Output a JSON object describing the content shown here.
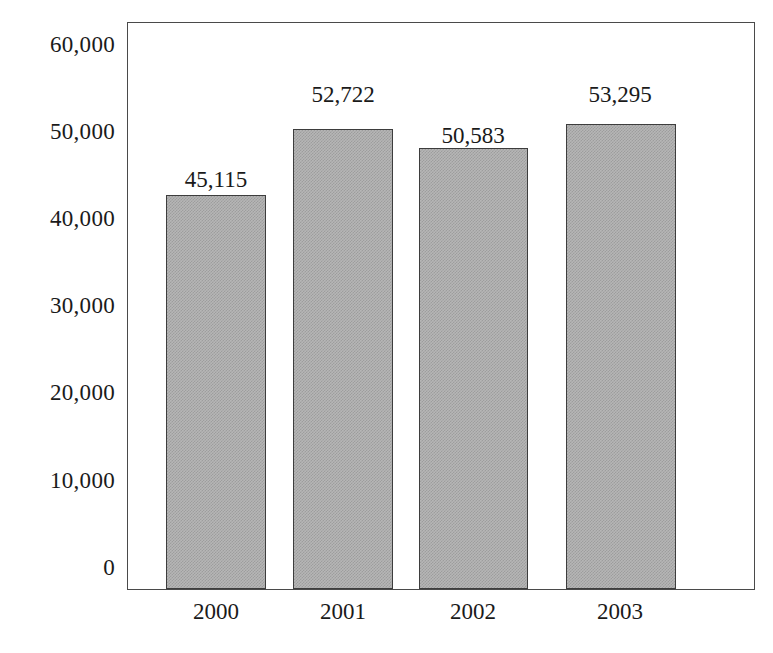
{
  "chart_data": {
    "type": "bar",
    "title": "",
    "subtitle": "",
    "xlabel": "",
    "ylabel": "",
    "categories": [
      "2000",
      "2001",
      "2002",
      "2003"
    ],
    "values": [
      45115,
      52722,
      50583,
      53295
    ],
    "value_labels": [
      "45,115",
      "52,722",
      "50,583",
      "53,295"
    ],
    "ylim": [
      0,
      60000
    ],
    "ytick_values": [
      60000,
      50000,
      40000,
      30000,
      20000,
      10000,
      0
    ],
    "ytick_labels": [
      "60,000",
      "50,000",
      "40,000",
      "30,000",
      "20,000",
      "10,000",
      "0"
    ],
    "grid": false,
    "legend": false,
    "legend_position": "none",
    "series": [
      {
        "name": "",
        "values": [
          45115,
          52722,
          50583,
          53295
        ]
      }
    ],
    "colors": {
      "bar_fill": "#b6b6b6",
      "bar_pattern": "#9d9d9d",
      "bar_border": "#3d3d3d",
      "axis_line": "#4a4a4a",
      "text": "#1a1a1a",
      "background": "#ffffff"
    }
  }
}
